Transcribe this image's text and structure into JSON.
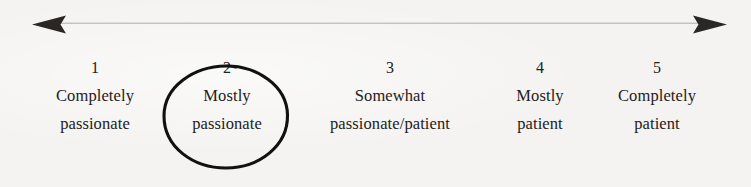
{
  "figure": {
    "type": "likert-scale",
    "background_color": "#f4f3f1",
    "text_color": "#242120",
    "axis": {
      "name": "double-headed-arrow",
      "color": "#4a4845",
      "left_arrow_tip_x": 32,
      "right_arrow_tip_x": 727,
      "y": 24,
      "line_thickness_px": 2
    },
    "selection": {
      "name": "hand-drawn-ellipse",
      "selected_value": "2",
      "color": "#101010",
      "stroke_width_px": 3
    }
  },
  "scale": {
    "points": [
      {
        "number": "1",
        "line1": "Completely",
        "line2": "passionate",
        "selected": false
      },
      {
        "number": "2",
        "line1": "Mostly",
        "line2": "passionate",
        "selected": true
      },
      {
        "number": "3",
        "line1": "Somewhat",
        "line2": "passionate/patient",
        "selected": false
      },
      {
        "number": "4",
        "line1": "Mostly",
        "line2": "patient",
        "selected": false
      },
      {
        "number": "5",
        "line1": "Completely",
        "line2": "patient",
        "selected": false
      }
    ]
  }
}
